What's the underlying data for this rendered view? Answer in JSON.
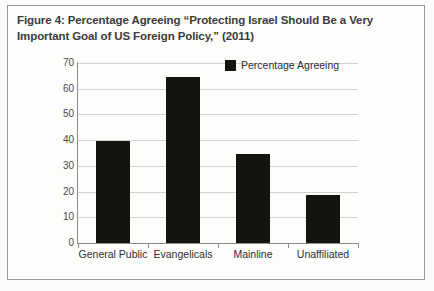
{
  "figure": {
    "caption_line1": "Figure 4: Percentage Agreeing “Protecting Israel Should Be a Very",
    "caption_line2": "Important Goal of US Foreign Policy,” (2011)"
  },
  "legend": {
    "marker_icon": "black-square-icon",
    "label": "Percentage Agreeing"
  },
  "axis": {
    "y_ticks": [
      "70",
      "60",
      "50",
      "40",
      "30",
      "20",
      "10",
      "0"
    ]
  },
  "chart_data": {
    "type": "bar",
    "title": "Figure 4: Percentage Agreeing “Protecting Israel Should Be a Very Important Goal of US Foreign Policy,” (2011)",
    "categories": [
      "General Public",
      "Evangelicals",
      "Mainline",
      "Unaffiliated"
    ],
    "series": [
      {
        "name": "Percentage Agreeing",
        "values": [
          39.5,
          64.5,
          34.5,
          18.5
        ],
        "color": "#151310"
      }
    ],
    "xlabel": "",
    "ylabel": "",
    "ylim": [
      0,
      70
    ],
    "ytick_step": 10,
    "grid": true,
    "legend_position": "top-right"
  }
}
